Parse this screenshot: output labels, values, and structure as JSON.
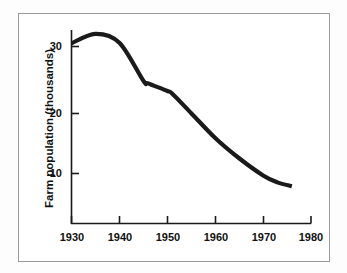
{
  "figure": {
    "background_color": "#ffffff",
    "frame_color": "#9a9a9a",
    "line_color": "#1a1a1a",
    "axis_color": "#1a1a1a"
  },
  "axes": {
    "y_title": "Farm population (thousands)",
    "x_title": "",
    "y_ticks": [
      "10",
      "20",
      "30"
    ],
    "x_ticks": [
      "1930",
      "1940",
      "1950",
      "1960",
      "1970",
      "1980"
    ]
  },
  "chart_data": {
    "type": "line",
    "title": "",
    "xlabel": "",
    "ylabel": "Farm population (thousands)",
    "xlim": [
      1930,
      1980
    ],
    "ylim": [
      0,
      34
    ],
    "yticks": [
      10,
      20,
      30
    ],
    "xticks": [
      1930,
      1940,
      1950,
      1960,
      1970,
      1980
    ],
    "grid": false,
    "legend": null,
    "series": [
      {
        "name": "Farm population",
        "x": [
          1930,
          1935,
          1940,
          1945,
          1946,
          1950,
          1951,
          1955,
          1960,
          1965,
          1970,
          1973,
          1976
        ],
        "values": [
          30.5,
          32.0,
          30.6,
          24.6,
          24.2,
          23.0,
          22.6,
          19.5,
          15.6,
          12.4,
          9.7,
          8.6,
          8.0
        ]
      }
    ]
  }
}
